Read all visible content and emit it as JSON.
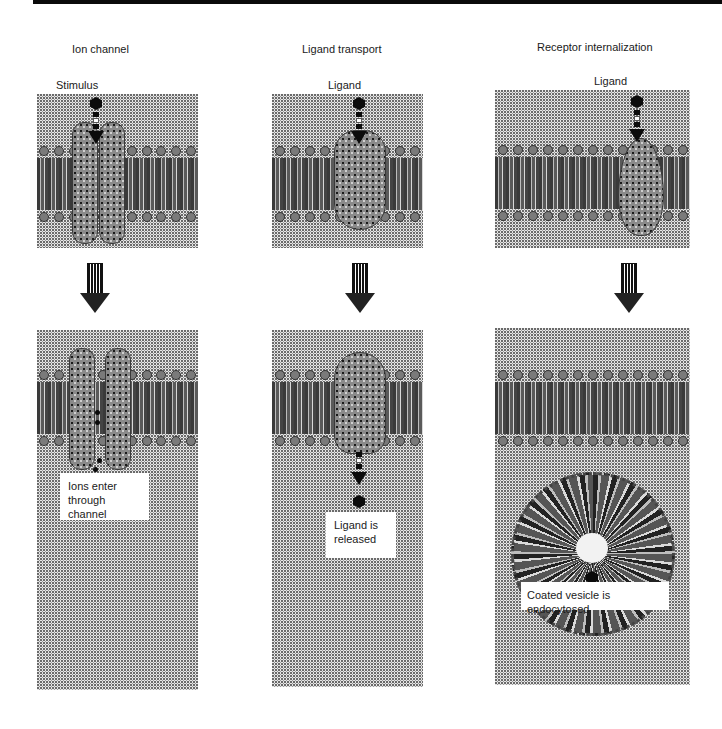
{
  "figure": {
    "columns": [
      {
        "title": "Ion channel",
        "stimulus_label": "Stimulus",
        "caption": "Ions enter through channel",
        "caption_line1": "Ions enter",
        "caption_line2": "through channel"
      },
      {
        "title": "Ligand transport",
        "stimulus_label": "Ligand",
        "caption": "Ligand is released",
        "caption_line1": "Ligand is",
        "caption_line2": "released"
      },
      {
        "title": "Receptor internalization",
        "stimulus_label": "Ligand",
        "caption": "Coated vesicle is endocytosed"
      }
    ],
    "icons": {
      "ligand": "hexagon-ligand-icon",
      "transition": "striped-down-arrow-icon",
      "binding": "dashed-down-arrow-icon",
      "ions": "ion-dots-icon",
      "vesicle": "coated-vesicle-icon"
    },
    "colors": {
      "background": "#ffffff",
      "panel_stipple": "#e6e6e6",
      "membrane_core": "#555555",
      "protein": "#8a8a8a",
      "ligand": "#0b0b0b",
      "top_bar": "#0a0a0a"
    }
  }
}
